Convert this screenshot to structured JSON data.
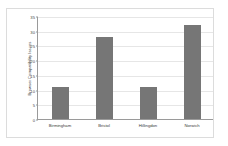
{
  "chart_data": {
    "type": "bar",
    "title": "",
    "subtitle": "",
    "xlabel": "",
    "ylabel": "Browser Compatibility Issues",
    "categories": [
      "Birmingham",
      "Bristol",
      "Hillingdon",
      "Norwich"
    ],
    "values": [
      11,
      28,
      11,
      32
    ],
    "series": [
      {
        "name": "Browser Compatibility Issues",
        "values": [
          11,
          28,
          11,
          32
        ]
      }
    ],
    "ylim": [
      0,
      35
    ],
    "ytick_labels": [
      "35",
      "30",
      "25",
      "20",
      "15",
      "10",
      "5",
      "0"
    ],
    "ytick_values": [
      35,
      30,
      25,
      20,
      15,
      10,
      5,
      0
    ],
    "ytick_step": 5,
    "grid": true,
    "grid_axis": "y",
    "legend": false,
    "legend_position": "none",
    "annotations": [],
    "colors": {
      "bar": "#767676",
      "gridline": "#e6e6e6",
      "axis": "#9a9a9a",
      "text": "#3a3a3a",
      "background": "#ffffff",
      "frame": "#dcdcdc"
    }
  }
}
